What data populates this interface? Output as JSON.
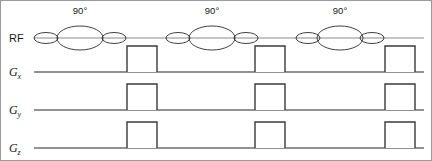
{
  "figure": {
    "width": 432,
    "height": 161,
    "background": "#ffffff",
    "frame_visible": true
  },
  "channels": [
    {
      "id": "rf",
      "label": "RF",
      "sub": "",
      "baseline_y": 38,
      "label_x": 9,
      "label_y": 41
    },
    {
      "id": "gx",
      "label": "G",
      "sub": "x",
      "baseline_y": 72,
      "label_x": 9,
      "label_y": 75
    },
    {
      "id": "gy",
      "label": "G",
      "sub": "y",
      "baseline_y": 110,
      "label_x": 9,
      "label_y": 113
    },
    {
      "id": "gz",
      "label": "G",
      "sub": "z",
      "baseline_y": 148,
      "label_x": 9,
      "label_y": 151
    }
  ],
  "axis": {
    "line_start_x": 34,
    "line_end_x": 424
  },
  "rf_pulses": [
    {
      "name": "rf-pulse-1",
      "angle_label": "90°",
      "label_x": 80,
      "label_y": 14,
      "center_x": 80,
      "lobes": [
        {
          "cx": 46,
          "rx": 12,
          "ry": 5.5
        },
        {
          "cx": 80,
          "rx": 23,
          "ry": 12
        },
        {
          "cx": 114,
          "rx": 12,
          "ry": 5.5
        }
      ]
    },
    {
      "name": "rf-pulse-2",
      "angle_label": "90°",
      "label_x": 212,
      "label_y": 14,
      "center_x": 212,
      "lobes": [
        {
          "cx": 178,
          "rx": 12,
          "ry": 5.5
        },
        {
          "cx": 212,
          "rx": 23,
          "ry": 12
        },
        {
          "cx": 246,
          "rx": 12,
          "ry": 5.5
        }
      ]
    },
    {
      "name": "rf-pulse-3",
      "angle_label": "90°",
      "label_x": 340,
      "label_y": 14,
      "center_x": 340,
      "lobes": [
        {
          "cx": 308,
          "rx": 12,
          "ry": 5.5
        },
        {
          "cx": 340,
          "rx": 23,
          "ry": 12
        },
        {
          "cx": 372,
          "rx": 12,
          "ry": 5.5
        }
      ]
    }
  ],
  "gradient_pulses": {
    "gx": [
      {
        "name": "gx-pulse-1",
        "x": 127,
        "width": 30,
        "height": 26
      },
      {
        "name": "gx-pulse-2",
        "x": 255,
        "width": 30,
        "height": 26
      },
      {
        "name": "gx-pulse-3",
        "x": 385,
        "width": 30,
        "height": 26
      }
    ],
    "gy": [
      {
        "name": "gy-pulse-1",
        "x": 127,
        "width": 30,
        "height": 26
      },
      {
        "name": "gy-pulse-2",
        "x": 255,
        "width": 30,
        "height": 26
      },
      {
        "name": "gy-pulse-3",
        "x": 385,
        "width": 30,
        "height": 26
      }
    ],
    "gz": [
      {
        "name": "gz-pulse-1",
        "x": 127,
        "width": 30,
        "height": 26
      },
      {
        "name": "gz-pulse-2",
        "x": 255,
        "width": 30,
        "height": 26
      },
      {
        "name": "gz-pulse-3",
        "x": 385,
        "width": 30,
        "height": 26
      }
    ]
  },
  "colors": {
    "baseline": "#6e6e6e",
    "rf_baseline": "#8a8a8a",
    "lobe_stroke": "#2b2b2b",
    "pulse_stroke": "#3a3a3a",
    "frame": "#9a9a9a",
    "text": "#1a1a1a"
  },
  "labels": {
    "rf": "RF",
    "gx_base": "G",
    "gx_sub": "x",
    "gy_base": "G",
    "gy_sub": "y",
    "gz_base": "G",
    "gz_sub": "z",
    "angle_1": "90°",
    "angle_2": "90°",
    "angle_3": "90°"
  }
}
